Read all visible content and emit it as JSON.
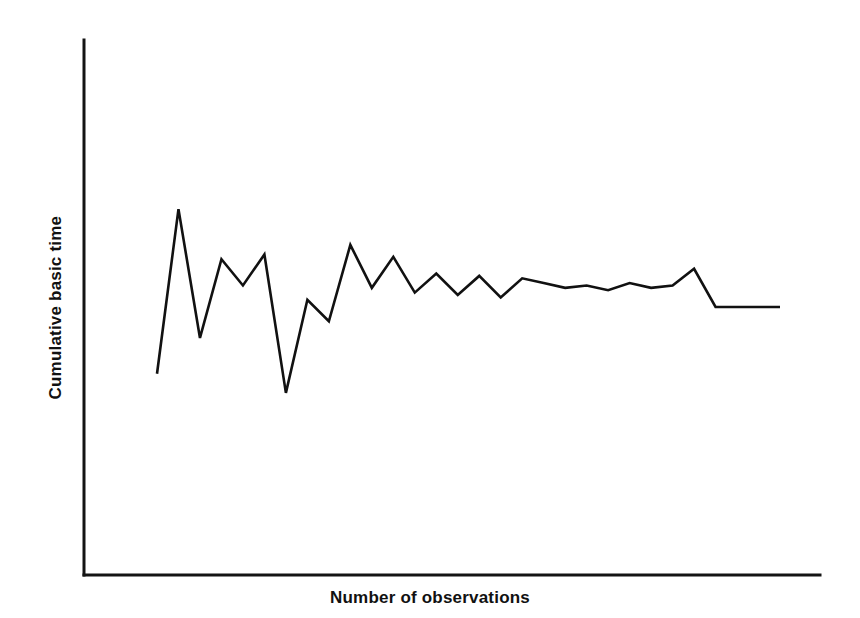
{
  "chart_data": {
    "type": "line",
    "title": "",
    "subtitle": "",
    "xlabel": "Number of observations",
    "ylabel": "Cumulative basic time",
    "grid": false,
    "legend": null,
    "annotations": [],
    "axis_tick_labels": {
      "x": [],
      "y": []
    },
    "xlim": [
      0,
      30
    ],
    "ylim": [
      0,
      10
    ],
    "series": [
      {
        "name": "Cumulative basic time",
        "color": "#111111",
        "x": [
          1,
          2,
          3,
          4,
          5,
          6,
          7,
          8,
          9,
          10,
          11,
          12,
          13,
          14,
          15,
          16,
          17,
          18,
          19,
          20,
          21,
          22,
          23,
          24,
          25,
          26,
          27,
          28,
          29,
          30
        ],
        "values": [
          3.55,
          7.0,
          4.3,
          5.95,
          5.4,
          6.05,
          3.15,
          5.1,
          4.65,
          6.25,
          5.35,
          6.0,
          5.25,
          5.65,
          5.2,
          5.6,
          5.15,
          5.55,
          5.45,
          5.35,
          5.4,
          5.3,
          5.45,
          5.35,
          5.4,
          5.75,
          4.95,
          4.95,
          4.95,
          4.95
        ]
      }
    ]
  },
  "axis_titles": {
    "y": "Cumulative basic time",
    "x": "Number of observations"
  },
  "colors": {
    "line": "#111111",
    "axis": "#141414",
    "background": "#ffffff"
  }
}
